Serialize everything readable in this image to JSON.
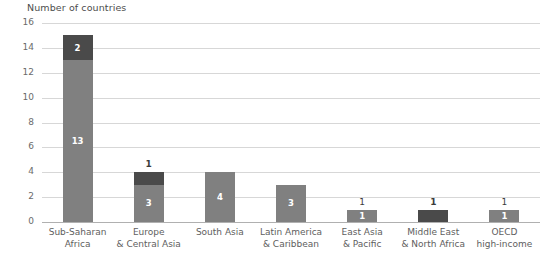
{
  "chart_data": {
    "type": "bar",
    "title": "Number of countries",
    "xlabel": "",
    "ylabel": "Number of countries",
    "ylim": [
      0,
      16
    ],
    "ytick_step": 2,
    "yticks": [
      "16",
      "14",
      "12",
      "10",
      "8",
      "6",
      "4",
      "2",
      "0"
    ],
    "grid": true,
    "legend": "none",
    "stacked": true,
    "categories": [
      "Sub-Saharan Africa",
      "Europe & Central Asia",
      "South Asia",
      "Latin America & Caribbean",
      "East Asia & Pacific",
      "Middle East & North Africa",
      "OECD high-income"
    ],
    "category_lines": [
      [
        "Sub-Saharan",
        "Africa"
      ],
      [
        "Europe",
        "& Central Asia"
      ],
      [
        "South Asia",
        ""
      ],
      [
        "Latin America",
        "& Caribbean"
      ],
      [
        "East Asia",
        "& Pacific"
      ],
      [
        "Middle East",
        "& North Africa"
      ],
      [
        "OECD",
        "high-income"
      ]
    ],
    "series": [
      {
        "name": "light",
        "color": "#808080",
        "values": [
          13,
          3,
          4,
          3,
          1,
          0,
          1
        ],
        "labels": [
          "13",
          "3",
          "4",
          "3",
          "1",
          "",
          "1"
        ]
      },
      {
        "name": "dark",
        "color": "#4a4a4a",
        "values": [
          2,
          1,
          0,
          0,
          0,
          1,
          0
        ],
        "labels": [
          "2",
          "",
          "",
          "",
          "",
          "",
          ""
        ]
      }
    ],
    "top_labels": [
      "",
      "1",
      "",
      "",
      "1",
      "1",
      "1"
    ],
    "top_labels_bold": [
      false,
      true,
      false,
      false,
      false,
      true,
      false
    ],
    "totals": [
      15,
      4,
      4,
      3,
      1,
      1,
      1
    ]
  },
  "colors": {
    "light_bar": "#808080",
    "dark_bar": "#4a4a4a",
    "gridline": "#d7d7d7",
    "baseline": "#b0b0b0",
    "text": "#5e5e5e",
    "background": "#ffffff"
  }
}
